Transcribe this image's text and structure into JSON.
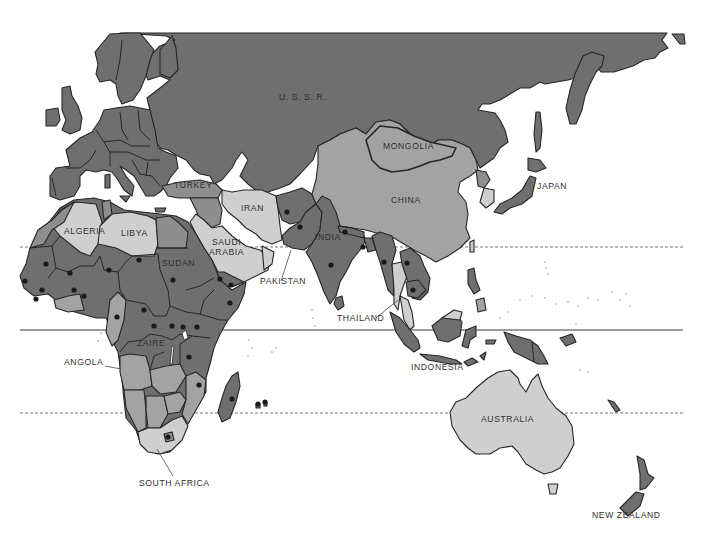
{
  "map": {
    "type": "thematic world map (grayscale, Europe/Africa/Asia/Oceania)",
    "shading_levels": {
      "dark": "#6f6f6f",
      "mid": "#8e8e8e",
      "medium_light": "#a3a3a3",
      "light": "#cfcfcf",
      "water": "#ffffff",
      "outline": "#262626"
    },
    "marker": {
      "shape": "filled-circle",
      "color": "#1a1a1a"
    }
  },
  "labels": [
    {
      "id": "ussr",
      "text": "U. S. S. R.",
      "x": 279,
      "y": 97
    },
    {
      "id": "mongolia",
      "text": "MONGOLIA",
      "x": 383,
      "y": 146
    },
    {
      "id": "japan",
      "text": "JAPAN",
      "x": 537,
      "y": 186
    },
    {
      "id": "china",
      "text": "CHINA",
      "x": 391,
      "y": 200
    },
    {
      "id": "turkey",
      "text": "TURKEY",
      "x": 174,
      "y": 185
    },
    {
      "id": "iran",
      "text": "IRAN",
      "x": 241,
      "y": 208
    },
    {
      "id": "algeria",
      "text": "ALGERIA",
      "x": 64,
      "y": 231
    },
    {
      "id": "libya",
      "text": "LIBYA",
      "x": 121,
      "y": 233
    },
    {
      "id": "saudi_arabia",
      "text": "SAUDI\nARABIA",
      "x": 209,
      "y": 242
    },
    {
      "id": "india",
      "text": "INDIA",
      "x": 315,
      "y": 237
    },
    {
      "id": "sudan",
      "text": "SUDAN",
      "x": 162,
      "y": 263
    },
    {
      "id": "pakistan",
      "text": "PAKISTAN",
      "x": 260,
      "y": 281
    },
    {
      "id": "thailand",
      "text": "THAILAND",
      "x": 337,
      "y": 318
    },
    {
      "id": "zaire",
      "text": "ZAIRE",
      "x": 137,
      "y": 343
    },
    {
      "id": "angola",
      "text": "ANGOLA",
      "x": 64,
      "y": 362
    },
    {
      "id": "indonesia",
      "text": "INDONESIA",
      "x": 411,
      "y": 367
    },
    {
      "id": "australia",
      "text": "AUSTRALIA",
      "x": 481,
      "y": 419
    },
    {
      "id": "south_africa",
      "text": "SOUTH AFRICA",
      "x": 139,
      "y": 483
    },
    {
      "id": "new_zealand",
      "text": "NEW ZEALAND",
      "x": 592,
      "y": 515
    }
  ],
  "reference_lines": [
    {
      "name": "tropic-of-cancer",
      "style": "dashed",
      "y": 247,
      "x1": 20,
      "x2": 683
    },
    {
      "name": "equator",
      "style": "solid",
      "y": 330,
      "x1": 20,
      "x2": 683
    },
    {
      "name": "tropic-of-capricorn",
      "style": "dashed",
      "y": 413,
      "x1": 20,
      "x2": 683
    }
  ],
  "markers": [
    [
      287,
      212
    ],
    [
      300,
      227
    ],
    [
      345,
      232
    ],
    [
      384,
      262
    ],
    [
      331,
      265
    ],
    [
      413,
      290
    ],
    [
      407,
      263
    ],
    [
      363,
      247
    ],
    [
      46,
      264
    ],
    [
      70,
      273
    ],
    [
      109,
      270
    ],
    [
      139,
      260
    ],
    [
      173,
      280
    ],
    [
      220,
      279
    ],
    [
      231,
      285
    ],
    [
      25,
      281
    ],
    [
      42,
      290
    ],
    [
      36,
      299
    ],
    [
      74,
      290
    ],
    [
      84,
      296
    ],
    [
      117,
      317
    ],
    [
      144,
      310
    ],
    [
      154,
      326
    ],
    [
      183,
      327
    ],
    [
      197,
      327
    ],
    [
      230,
      303
    ],
    [
      172,
      326
    ],
    [
      189,
      357
    ],
    [
      199,
      385
    ],
    [
      232,
      399
    ],
    [
      168,
      437
    ],
    [
      258,
      404
    ],
    [
      265,
      402
    ]
  ],
  "leader_lines": [
    {
      "for": "pakistan",
      "from": [
        281,
        281
      ],
      "to": [
        291,
        250
      ]
    },
    {
      "for": "thailand",
      "from": [
        376,
        318
      ],
      "to": [
        398,
        300
      ]
    },
    {
      "for": "angola",
      "from": [
        105,
        366
      ],
      "to": [
        121,
        369
      ]
    },
    {
      "for": "south_africa",
      "from": [
        173,
        476
      ],
      "to": [
        157,
        449
      ]
    }
  ]
}
